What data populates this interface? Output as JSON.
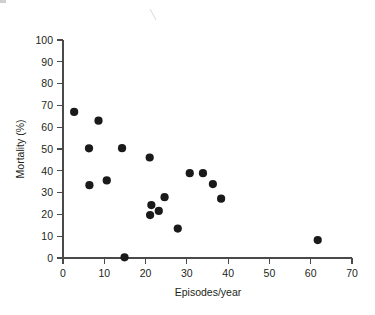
{
  "chart_data": {
    "type": "scatter",
    "title": "",
    "xlabel": "Episodes/year",
    "ylabel": "Mortality (%)",
    "xlim": [
      0,
      70
    ],
    "ylim": [
      0,
      100
    ],
    "xticks": [
      0,
      10,
      20,
      30,
      40,
      50,
      60,
      70
    ],
    "yticks": [
      0,
      10,
      20,
      30,
      40,
      50,
      60,
      70,
      80,
      90,
      100
    ],
    "grid": false,
    "legend": null,
    "series": [
      {
        "name": "observations",
        "marker": "filled-circle",
        "color": "#1a1a1a",
        "points": [
          {
            "x": 2.7,
            "y": 67.0
          },
          {
            "x": 6.3,
            "y": 50.3
          },
          {
            "x": 6.4,
            "y": 33.4
          },
          {
            "x": 8.6,
            "y": 63.0
          },
          {
            "x": 10.6,
            "y": 35.6
          },
          {
            "x": 14.3,
            "y": 50.4
          },
          {
            "x": 14.9,
            "y": 0.3
          },
          {
            "x": 21.0,
            "y": 46.1
          },
          {
            "x": 21.1,
            "y": 19.7
          },
          {
            "x": 21.4,
            "y": 24.3
          },
          {
            "x": 23.2,
            "y": 21.6
          },
          {
            "x": 24.6,
            "y": 27.9
          },
          {
            "x": 27.8,
            "y": 13.5
          },
          {
            "x": 30.7,
            "y": 38.9
          },
          {
            "x": 33.9,
            "y": 38.9
          },
          {
            "x": 36.3,
            "y": 33.9
          },
          {
            "x": 38.3,
            "y": 27.2
          },
          {
            "x": 61.7,
            "y": 8.2
          }
        ]
      }
    ]
  },
  "axes": {
    "x_tick_labels": [
      "0",
      "10",
      "20",
      "30",
      "40",
      "50",
      "60",
      "70"
    ],
    "y_tick_labels": [
      "0",
      "10",
      "20",
      "30",
      "40",
      "50",
      "60",
      "70",
      "80",
      "90",
      "100"
    ],
    "x_axis_title": "Episodes/year",
    "y_axis_title": "Mortality (%)"
  }
}
